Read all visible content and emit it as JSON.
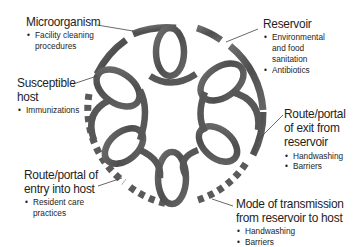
{
  "diagram": {
    "type": "chain-of-infection",
    "ring_color": "#5a5a5a",
    "ring_highlight": "#8a8a8a",
    "leader_color": "#444444",
    "links": [
      {
        "title": "Microorganism",
        "bullets": [
          "Facility cleaning",
          "procedures"
        ]
      },
      {
        "title": "Reservoir",
        "bullets": [
          "Environmental",
          "and food",
          "sanitation",
          "Antibiotics"
        ]
      },
      {
        "title_lines": [
          "Route/portal",
          "of exit from",
          "reservoir"
        ],
        "bullets": [
          "Handwashing",
          "Barriers"
        ]
      },
      {
        "title_lines": [
          "Mode of transmission",
          "from reservoir to host"
        ],
        "bullets": [
          "Handwashing",
          "Barriers"
        ]
      },
      {
        "title_lines": [
          "Route/portal of",
          "entry into host"
        ],
        "bullets": [
          "Resident care",
          "practices"
        ]
      },
      {
        "title_lines": [
          "Susceptible",
          "host"
        ],
        "bullets": [
          "Immunizations"
        ]
      }
    ]
  }
}
